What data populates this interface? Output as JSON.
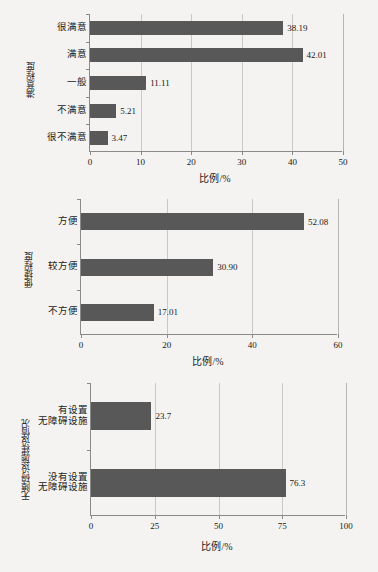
{
  "page": {
    "background": "#f4f3f1",
    "bar_color": "#585858",
    "axis_color": "#8a8a8a",
    "grid_color": "#c9c9c9"
  },
  "chart_data": [
    {
      "type": "bar",
      "orientation": "horizontal",
      "title": "",
      "xlabel": "比例/%",
      "ylabel": "满意程度",
      "categories": [
        "很不满意",
        "不满意",
        "一般",
        "满意",
        "很满意"
      ],
      "values": [
        3.47,
        5.21,
        11.11,
        42.01,
        38.19
      ],
      "value_labels": [
        "3.47",
        "5.21",
        "11.11",
        "42.01",
        "38.19"
      ],
      "xlim": [
        0,
        50
      ],
      "xticks": [
        0,
        10,
        20,
        30,
        40,
        50
      ],
      "xticklabels": [
        "0",
        "10",
        "20",
        "30",
        "40",
        "50"
      ],
      "grid": true,
      "legend": "none"
    },
    {
      "type": "bar",
      "orientation": "horizontal",
      "title": "",
      "xlabel": "比例/%",
      "ylabel": "便捷程度",
      "categories": [
        "不方便",
        "较方便",
        "方便"
      ],
      "values": [
        17.01,
        30.9,
        52.08
      ],
      "value_labels": [
        "17.01",
        "30.90",
        "52.08"
      ],
      "xlim": [
        0,
        60
      ],
      "xticks": [
        0,
        20,
        40,
        60
      ],
      "xticklabels": [
        "0",
        "20",
        "40",
        "60"
      ],
      "grid": true,
      "legend": "none"
    },
    {
      "type": "bar",
      "orientation": "horizontal",
      "title": "",
      "xlabel": "比例/%",
      "ylabel": "无障碍设施建设情况",
      "categories": [
        "没有设置\n无障碍设施",
        "有设置\n无障碍设施"
      ],
      "values": [
        76.3,
        23.7
      ],
      "value_labels": [
        "76.3",
        "23.7"
      ],
      "xlim": [
        0,
        100
      ],
      "xticks": [
        0,
        25,
        50,
        75,
        100
      ],
      "xticklabels": [
        "0",
        "25",
        "50",
        "75",
        "100"
      ],
      "grid": true,
      "legend": "none"
    }
  ]
}
